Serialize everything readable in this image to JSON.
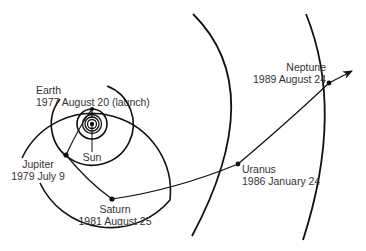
{
  "diagram": {
    "colors": {
      "line": "#111111",
      "text": "#333333",
      "background": "#ffffff"
    },
    "labels": {
      "earth": {
        "name": "Earth",
        "date": "1977 August 20 (launch)"
      },
      "sun": {
        "name": "Sun"
      },
      "jupiter": {
        "name": "Jupiter",
        "date": "1979 July 9"
      },
      "saturn": {
        "name": "Saturn",
        "date": "1981 August 25"
      },
      "uranus": {
        "name": "Uranus",
        "date": "1986 January 24"
      },
      "neptune": {
        "name": "Neptune",
        "date": "1989 August 24"
      }
    }
  }
}
